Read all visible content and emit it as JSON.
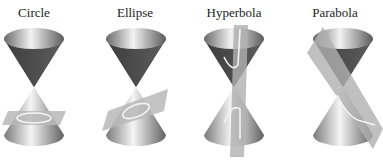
{
  "panels": [
    {
      "label": "Circle"
    },
    {
      "label": "Ellipse"
    },
    {
      "label": "Hyperbola"
    },
    {
      "label": "Parabola"
    }
  ],
  "colors": {
    "cone_dark": "#4a4a4a",
    "cone_light": "#d8d8d8",
    "plane": "#b8b8b8",
    "curve": "#f0f0f0"
  }
}
